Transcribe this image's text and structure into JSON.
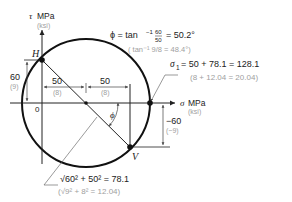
{
  "axes": {
    "tau_label": "τ",
    "tau_unit": "MPa",
    "tau_unit_alt": "(ksi)",
    "sigma_label": "σ",
    "sigma_unit": "MPa",
    "sigma_unit_alt": "(ksi)",
    "origin_label": "0"
  },
  "points": {
    "H": "H",
    "V": "V"
  },
  "dimensions": {
    "tau_xy": "60",
    "tau_xy_alt": "(9)",
    "center_offset": "50",
    "center_offset_alt": "(8)",
    "half_width": "50",
    "half_width_alt": "(8)",
    "neg_tau": "−60",
    "neg_tau_alt": "(−9)"
  },
  "angle_label": "ϕ",
  "phi_equation": {
    "lhs": "ϕ = tan",
    "sup": "−1",
    "num": "60",
    "den": "50",
    "rhs": "= 50.2°",
    "alt": "( tan⁻¹ 9/8 = 48.4°)"
  },
  "sigma1_equation": {
    "sym": "σ",
    "sub": "1",
    "text": "= 50 + 78.1 = 128.1",
    "alt": "(8 + 12.04 = 20.04)"
  },
  "radius_equation": {
    "text": "√60² + 50² = 78.1",
    "alt": "(√9² + 8² = 12.04)"
  }
}
